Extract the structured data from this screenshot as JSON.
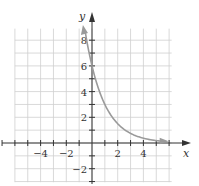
{
  "chart_data": {
    "type": "line",
    "title": "",
    "xlabel": "x",
    "ylabel": "y",
    "xlim": [
      -6.2,
      6.0
    ],
    "ylim": [
      -3.1,
      9.0
    ],
    "grid": true,
    "legend": null,
    "function": "y = 6(1/2)^x",
    "x_ticks": [
      -4,
      -2,
      2,
      4
    ],
    "y_ticks": [
      -2,
      2,
      4,
      6,
      8
    ],
    "x_tick_labels": [
      "−4",
      "−2",
      "2",
      "4"
    ],
    "y_tick_labels": [
      "−2",
      "2",
      "4",
      "6",
      "8"
    ],
    "series": [
      {
        "name": "exponential decay",
        "color": "#9a9a9a",
        "x": [
          -0.55,
          -0.5,
          0,
          0.5,
          1,
          1.5,
          2,
          2.5,
          3,
          3.5,
          4,
          4.5,
          5,
          5.5
        ],
        "y": [
          8.78,
          8.49,
          6,
          4.24,
          3,
          2.12,
          1.5,
          1.06,
          0.75,
          0.53,
          0.375,
          0.27,
          0.19,
          0.13
        ]
      }
    ],
    "annotations": [
      "arrowheads at both ends of curve"
    ]
  },
  "colors": {
    "grid": "#cfcfcf",
    "axis": "#333333",
    "curve": "#9a9a9a"
  },
  "axis_labels": {
    "x": "x",
    "y": "y"
  }
}
